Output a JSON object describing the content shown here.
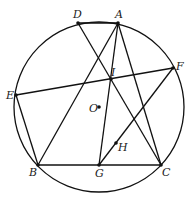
{
  "diagram": {
    "type": "geometry",
    "circle": {
      "center": "O",
      "cx": 99,
      "cy": 107,
      "r": 85
    },
    "points": {
      "A": {
        "x": 118,
        "y": 23,
        "label": "A"
      },
      "D": {
        "x": 78,
        "y": 23,
        "label": "D"
      },
      "E": {
        "x": 16,
        "y": 95,
        "label": "E"
      },
      "F": {
        "x": 173,
        "y": 68,
        "label": "F"
      },
      "B": {
        "x": 38,
        "y": 165,
        "label": "B"
      },
      "G": {
        "x": 99,
        "y": 165,
        "label": "G"
      },
      "C": {
        "x": 161,
        "y": 165,
        "label": "C"
      },
      "I": {
        "x": 111,
        "y": 79,
        "label": "I"
      },
      "O": {
        "x": 99,
        "y": 107,
        "label": "O"
      },
      "H": {
        "x": 116,
        "y": 143,
        "label": "H"
      }
    },
    "segments": [
      "D-C",
      "A-B",
      "A-G",
      "A-C",
      "E-F",
      "E-B",
      "F-G",
      "B-C"
    ]
  }
}
